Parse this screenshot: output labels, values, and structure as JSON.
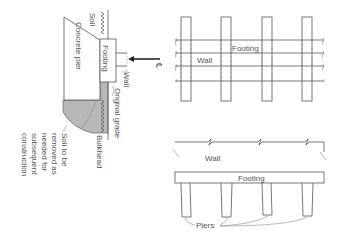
{
  "section_view": {
    "labels": {
      "soil": "Soil",
      "concrete_pier": "Concrete pier",
      "footing": "Footing",
      "wall": "Wall",
      "centerline": "℄",
      "original_grade": "Original grade",
      "bulkhead": "Bulkhead",
      "soil_removed_lines": [
        "Soil to be",
        "removed as",
        "needed for",
        "subsequent",
        "construction"
      ]
    }
  },
  "plan_view": {
    "labels": {
      "footing": "Footing",
      "wall": "Wall"
    },
    "pier_count": 4
  },
  "elevation_view": {
    "labels": {
      "wall": "Wall",
      "footing": "Footing",
      "piers": "Piers"
    },
    "pier_count": 4
  },
  "colors": {
    "line": "#555555",
    "fill_gray": "#b8b8b8",
    "fill_dark": "#9a9a9a",
    "background": "#ffffff"
  }
}
